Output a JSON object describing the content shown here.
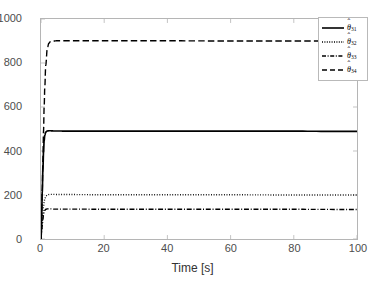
{
  "chart_data": {
    "type": "line",
    "title": "",
    "xlabel": "Time [s]",
    "ylabel": "",
    "xlim": [
      0,
      100
    ],
    "ylim": [
      0,
      1000
    ],
    "xticks": [
      0,
      20,
      40,
      60,
      80,
      100
    ],
    "yticks": [
      0,
      200,
      400,
      600,
      800,
      1000
    ],
    "grid": false,
    "legend_position": "top-right",
    "series": [
      {
        "name": "theta-hat-31",
        "label_base": "θ",
        "label_sub": "31",
        "linestyle": "solid",
        "color": "#000000",
        "steady_state": 490,
        "initial": 0,
        "rise_time_s": 1.2,
        "x": [
          0,
          0.2,
          0.4,
          0.6,
          0.8,
          1.0,
          1.2,
          1.5,
          2.0,
          2.5,
          3.0,
          4.0,
          5.0,
          10,
          20,
          40,
          60,
          80,
          100
        ],
        "values": [
          0,
          105,
          215,
          315,
          395,
          448,
          472,
          486,
          491,
          492,
          492,
          491,
          491,
          490,
          490,
          490,
          490,
          490,
          489
        ]
      },
      {
        "name": "theta-hat-32",
        "label_base": "θ",
        "label_sub": "32",
        "linestyle": "dotted",
        "color": "#000000",
        "steady_state": 200,
        "initial": 0,
        "rise_time_s": 1.6,
        "x": [
          0,
          0.2,
          0.4,
          0.6,
          0.8,
          1.0,
          1.2,
          1.5,
          2.0,
          2.5,
          3.0,
          4.0,
          5.0,
          10,
          20,
          40,
          60,
          80,
          100
        ],
        "values": [
          0,
          38,
          80,
          118,
          148,
          170,
          183,
          194,
          200,
          202,
          203,
          203,
          202,
          202,
          201,
          201,
          201,
          200,
          200
        ]
      },
      {
        "name": "theta-hat-33",
        "label_base": "θ",
        "label_sub": "33",
        "linestyle": "dashdot",
        "color": "#000000",
        "steady_state": 135,
        "initial": 0,
        "rise_time_s": 1.3,
        "x": [
          0,
          0.2,
          0.4,
          0.6,
          0.8,
          1.0,
          1.2,
          1.5,
          2.0,
          2.5,
          3.0,
          4.0,
          5.0,
          10,
          20,
          40,
          60,
          80,
          100
        ],
        "values": [
          0,
          30,
          62,
          90,
          110,
          123,
          130,
          135,
          137,
          137,
          137,
          136,
          136,
          136,
          135,
          135,
          135,
          135,
          134
        ]
      },
      {
        "name": "theta-hat-34",
        "label_base": "θ",
        "label_sub": "34",
        "linestyle": "dashed",
        "color": "#000000",
        "steady_state": 900,
        "initial": 0,
        "rise_time_s": 2.2,
        "x": [
          0,
          0.2,
          0.4,
          0.6,
          0.8,
          1.0,
          1.2,
          1.5,
          2.0,
          2.5,
          3.0,
          4.0,
          5.0,
          10,
          20,
          40,
          60,
          80,
          100
        ],
        "values": [
          0,
          95,
          225,
          360,
          490,
          600,
          690,
          790,
          868,
          890,
          897,
          900,
          901,
          901,
          901,
          901,
          900,
          900,
          900
        ]
      }
    ]
  },
  "axis": {
    "xlabel": "Time [s]",
    "xticklabels": [
      "0",
      "20",
      "40",
      "60",
      "80",
      "100"
    ],
    "yticklabels": [
      "0",
      "200",
      "400",
      "600",
      "800",
      "1000"
    ]
  },
  "legend": {
    "entries": [
      {
        "base": "θ",
        "sub": "31",
        "hat": "ˆ",
        "style": "solid"
      },
      {
        "base": "θ",
        "sub": "32",
        "hat": "ˆ",
        "style": "dotted"
      },
      {
        "base": "θ",
        "sub": "33",
        "hat": "ˆ",
        "style": "dashdot"
      },
      {
        "base": "θ",
        "sub": "34",
        "hat": "ˆ",
        "style": "dashed"
      }
    ]
  },
  "colors": {
    "line": "#000000",
    "frame": "#b5b5b5",
    "tick_text": "#4d4d4d",
    "background": "#ffffff"
  }
}
